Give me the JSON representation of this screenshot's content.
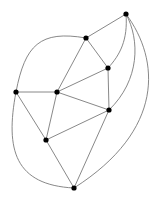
{
  "diagram": {
    "type": "planar-graph",
    "colors": {
      "edge": "#7a7a7a",
      "node": "#000000",
      "background": "#ffffff"
    },
    "nodes": [
      {
        "id": "A",
        "x": 126,
        "y": 14
      },
      {
        "id": "B",
        "x": 86,
        "y": 38
      },
      {
        "id": "C",
        "x": 108,
        "y": 68
      },
      {
        "id": "D",
        "x": 16,
        "y": 92
      },
      {
        "id": "E",
        "x": 57,
        "y": 92
      },
      {
        "id": "F",
        "x": 109,
        "y": 110
      },
      {
        "id": "G",
        "x": 46,
        "y": 140
      },
      {
        "id": "H",
        "x": 74,
        "y": 188
      }
    ],
    "edges": [
      {
        "id": "A-B",
        "d": "M126,14 L86,38"
      },
      {
        "id": "A-C",
        "d": "M126,14 C128,40 120,55 108,68"
      },
      {
        "id": "A-F",
        "d": "M126,14 C140,40 140,80 109,110"
      },
      {
        "id": "A-H",
        "d": "M126,14 C160,60 165,130 74,188"
      },
      {
        "id": "B-C",
        "d": "M86,38 L108,68"
      },
      {
        "id": "B-E",
        "d": "M86,38 L57,92"
      },
      {
        "id": "B-D",
        "d": "M86,38 C40,30 25,45 16,92"
      },
      {
        "id": "C-E",
        "d": "M108,68 L57,92"
      },
      {
        "id": "C-F",
        "d": "M108,68 L109,110"
      },
      {
        "id": "D-E",
        "d": "M16,92 L57,92"
      },
      {
        "id": "D-G",
        "d": "M16,92 L46,140"
      },
      {
        "id": "D-H",
        "d": "M16,92 C5,150 15,185 74,188"
      },
      {
        "id": "E-F",
        "d": "M57,92 L109,110"
      },
      {
        "id": "E-G",
        "d": "M57,92 L46,140"
      },
      {
        "id": "F-G",
        "d": "M109,110 L46,140"
      },
      {
        "id": "F-H",
        "d": "M109,110 L74,188"
      },
      {
        "id": "G-H",
        "d": "M46,140 L74,188"
      }
    ]
  }
}
